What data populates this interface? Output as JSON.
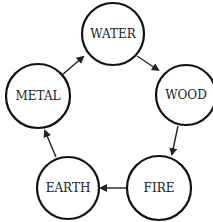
{
  "diagram": {
    "type": "cycle",
    "title": "",
    "nodes": [
      {
        "id": "water",
        "label": "WATER",
        "cx": 113,
        "cy": 34,
        "r": 31
      },
      {
        "id": "wood",
        "label": "WOOD",
        "cx": 186,
        "cy": 95,
        "r": 30
      },
      {
        "id": "fire",
        "label": "FIRE",
        "cx": 159,
        "cy": 188,
        "r": 32
      },
      {
        "id": "earth",
        "label": "EARTH",
        "cx": 68,
        "cy": 188,
        "r": 31
      },
      {
        "id": "metal",
        "label": "METAL",
        "cx": 38,
        "cy": 96,
        "r": 32
      }
    ],
    "edges": [
      {
        "from": "metal",
        "to": "water",
        "x1": 62,
        "y1": 75,
        "x2": 83,
        "y2": 57
      },
      {
        "from": "water",
        "to": "wood",
        "x1": 137,
        "y1": 56,
        "x2": 158,
        "y2": 70
      },
      {
        "from": "wood",
        "to": "fire",
        "x1": 178,
        "y1": 126,
        "x2": 172,
        "y2": 154
      },
      {
        "from": "fire",
        "to": "earth",
        "x1": 127,
        "y1": 188,
        "x2": 101,
        "y2": 188
      },
      {
        "from": "earth",
        "to": "metal",
        "x1": 56,
        "y1": 157,
        "x2": 45,
        "y2": 131
      }
    ],
    "colors": {
      "stroke": "#111111",
      "fill": "#ffffff",
      "text": "#222222"
    }
  }
}
